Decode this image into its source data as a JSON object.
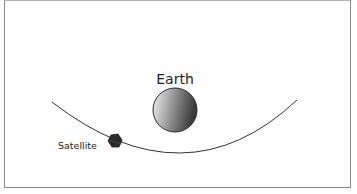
{
  "diagram": {
    "earth": {
      "label": "Earth",
      "cx": 175,
      "cy": 110,
      "r": 22
    },
    "satellite": {
      "label": "Satellite",
      "x": 115,
      "y": 141
    },
    "orbit": {
      "path": "M52,102 Q185,205 297,100"
    },
    "colors": {
      "line": "#333333",
      "earth_light": "#f2f2f2",
      "earth_dark": "#3e3e3e",
      "satellite": "#2a2a2a",
      "border": "#8a8a8a"
    }
  }
}
